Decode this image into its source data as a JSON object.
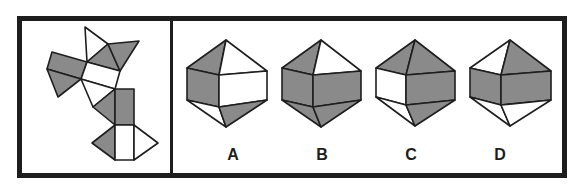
{
  "puzzle": {
    "type": "net-folding",
    "colors": {
      "shaded": "#8a8a8a",
      "unshaded": "#ffffff",
      "stroke": "#1e1e1e",
      "frame": "#1e1e1e"
    },
    "options": [
      {
        "label": "A"
      },
      {
        "label": "B"
      },
      {
        "label": "C"
      },
      {
        "label": "D"
      }
    ]
  }
}
